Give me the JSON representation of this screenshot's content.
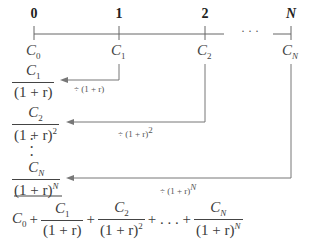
{
  "timeline": {
    "periods": [
      "0",
      "1",
      "2",
      "N"
    ],
    "ellipsis": "· · ·",
    "cash_flows": [
      {
        "sym": "C",
        "sub": "0"
      },
      {
        "sym": "C",
        "sub": "1"
      },
      {
        "sym": "C",
        "sub": "2"
      },
      {
        "sym": "C",
        "sub": "N"
      }
    ]
  },
  "discounted": [
    {
      "num_sym": "C",
      "num_sub": "1",
      "den": "(1 + r)",
      "den_exp": "",
      "arrow_label": "÷ (1 + r)",
      "arrow_exp": ""
    },
    {
      "num_sym": "C",
      "num_sub": "2",
      "den": "(1 + r)",
      "den_exp": "2",
      "arrow_label": "÷ (1 + r)",
      "arrow_exp": "2"
    },
    {
      "num_sym": "C",
      "num_sub": "N",
      "den": "(1 + r)",
      "den_exp": "N",
      "arrow_label": "÷ (1 + r)",
      "arrow_exp": "N"
    }
  ],
  "vertical_dots": "⋮",
  "sum": {
    "c0": "C",
    "c0_sub": "0",
    "plus": "+",
    "ellipsis_plus": "+ . . . +",
    "terms": [
      {
        "num_sym": "C",
        "num_sub": "1",
        "den": "(1 + r)",
        "den_exp": ""
      },
      {
        "num_sym": "C",
        "num_sub": "2",
        "den": "(1 + r)",
        "den_exp": "2"
      },
      {
        "num_sym": "C",
        "num_sub": "N",
        "den": "(1 + r)",
        "den_exp": "N"
      }
    ]
  },
  "colors": {
    "line": "#5a5a5a",
    "text": "#333333"
  }
}
